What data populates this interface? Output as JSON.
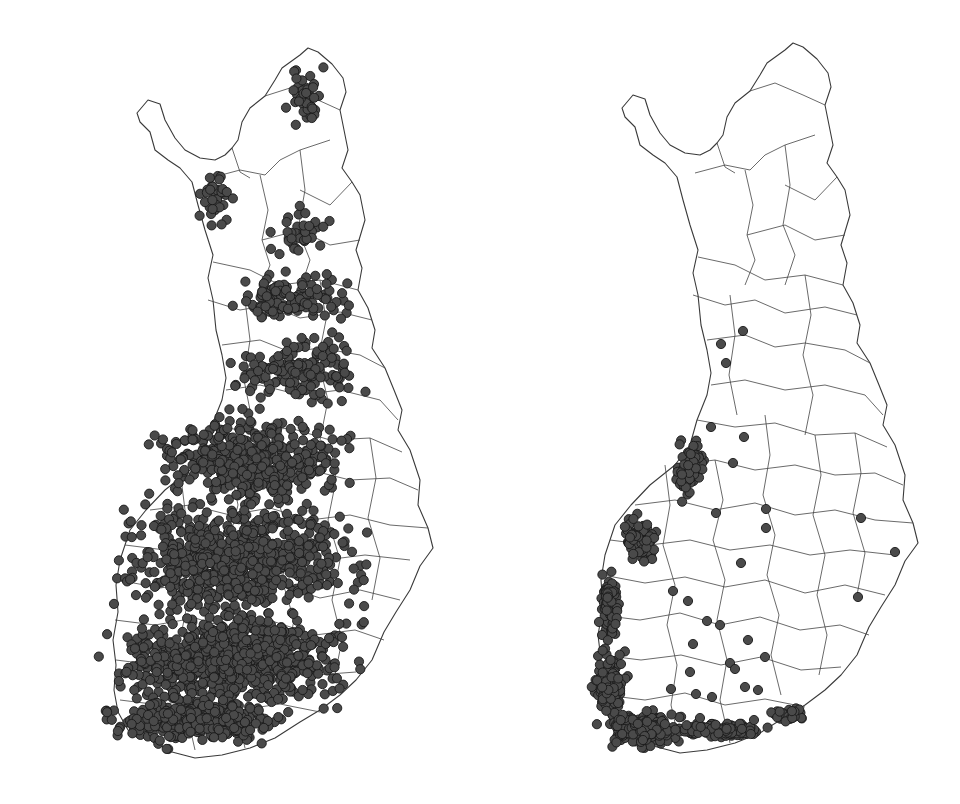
{
  "figure": {
    "panels": [
      {
        "id": "left",
        "description": "Finland municipalities map with dense point distribution across the country",
        "offset_x": 0,
        "point_color": "#4a4a4a",
        "clusters": [
          {
            "cx": 305,
            "cy": 95,
            "rx": 30,
            "ry": 40,
            "n": 45
          },
          {
            "cx": 215,
            "cy": 200,
            "rx": 20,
            "ry": 35,
            "n": 35
          },
          {
            "cx": 300,
            "cy": 230,
            "rx": 45,
            "ry": 30,
            "n": 35
          },
          {
            "cx": 290,
            "cy": 300,
            "rx": 75,
            "ry": 30,
            "n": 120
          },
          {
            "cx": 300,
            "cy": 370,
            "rx": 80,
            "ry": 45,
            "n": 150
          },
          {
            "cx": 250,
            "cy": 460,
            "rx": 120,
            "ry": 60,
            "n": 450
          },
          {
            "cx": 240,
            "cy": 560,
            "rx": 150,
            "ry": 70,
            "n": 700
          },
          {
            "cx": 230,
            "cy": 660,
            "rx": 150,
            "ry": 60,
            "n": 800
          },
          {
            "cx": 200,
            "cy": 720,
            "rx": 110,
            "ry": 30,
            "n": 400
          }
        ]
      },
      {
        "id": "right",
        "description": "Finland municipalities map with points concentrated along the western and southern coast",
        "offset_x": 485,
        "point_color": "#4a4a4a",
        "clusters": [
          {
            "cx": 690,
            "cy": 470,
            "rx": 18,
            "ry": 40,
            "n": 60
          },
          {
            "cx": 640,
            "cy": 540,
            "rx": 22,
            "ry": 30,
            "n": 70
          },
          {
            "cx": 610,
            "cy": 610,
            "rx": 12,
            "ry": 50,
            "n": 90
          },
          {
            "cx": 610,
            "cy": 680,
            "rx": 22,
            "ry": 40,
            "n": 140
          },
          {
            "cx": 640,
            "cy": 730,
            "rx": 50,
            "ry": 22,
            "n": 200
          },
          {
            "cx": 720,
            "cy": 730,
            "rx": 60,
            "ry": 10,
            "n": 120
          },
          {
            "cx": 790,
            "cy": 715,
            "rx": 25,
            "ry": 8,
            "n": 40
          }
        ],
        "isolated_points": [
          [
            721,
            344
          ],
          [
            743,
            331
          ],
          [
            726,
            363
          ],
          [
            711,
            427
          ],
          [
            744,
            437
          ],
          [
            733,
            463
          ],
          [
            716,
            513
          ],
          [
            766,
            509
          ],
          [
            766,
            528
          ],
          [
            741,
            563
          ],
          [
            861,
            518
          ],
          [
            895,
            552
          ],
          [
            858,
            597
          ],
          [
            673,
            591
          ],
          [
            688,
            601
          ],
          [
            707,
            621
          ],
          [
            720,
            625
          ],
          [
            748,
            640
          ],
          [
            693,
            644
          ],
          [
            730,
            663
          ],
          [
            690,
            672
          ],
          [
            671,
            689
          ],
          [
            696,
            694
          ],
          [
            712,
            697
          ],
          [
            735,
            669
          ],
          [
            765,
            657
          ],
          [
            700,
            718
          ],
          [
            745,
            687
          ],
          [
            758,
            690
          ],
          [
            754,
            720
          ]
        ]
      }
    ]
  }
}
